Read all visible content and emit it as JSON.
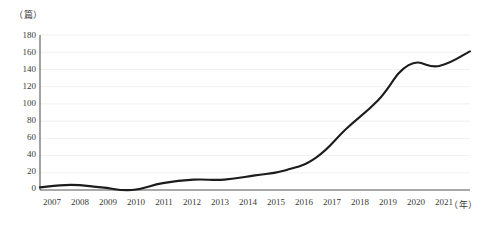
{
  "chart_data": {
    "type": "line",
    "title": "",
    "subtitle": "",
    "xlabel": "（年）",
    "ylabel": "（篇）",
    "y_unit_label": "（篇）",
    "x_unit_label": "（年）",
    "categories": [
      "2007",
      "2008",
      "2009",
      "2010",
      "2011",
      "2012",
      "2013",
      "2014",
      "2015",
      "2016",
      "2017",
      "2018",
      "2019",
      "2020",
      "2021"
    ],
    "values": [
      3,
      6,
      3,
      0,
      8,
      12,
      12,
      17,
      23,
      38,
      72,
      104,
      145,
      144,
      161
    ],
    "series": [
      {
        "name": "发文量",
        "values": [
          3,
          6,
          3,
          0,
          8,
          12,
          12,
          17,
          23,
          38,
          72,
          104,
          145,
          144,
          161
        ],
        "color": "#1c1c1c"
      }
    ],
    "ylim": [
      0,
      180
    ],
    "ytick_step": 20,
    "yticks": [
      "180",
      "160",
      "140",
      "120",
      "100",
      "80",
      "60",
      "40",
      "20",
      "0"
    ],
    "ytick_values": [
      180,
      160,
      140,
      120,
      100,
      80,
      60,
      40,
      20,
      0
    ],
    "xlim": [
      "2007",
      "2021"
    ],
    "grid": true,
    "grid_axis": "y",
    "legend": false,
    "legend_position": "none",
    "line_color": "#1c1c1c",
    "grid_color": "#e9e9e9",
    "axis_color": "#555555",
    "markers": false,
    "annotations": []
  }
}
